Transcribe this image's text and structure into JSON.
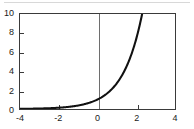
{
  "figure": {
    "source_id": "SAM0186-1Y",
    "axis_color": "#3a3a3a",
    "curve_color": "#111111",
    "reference_line_color": "#6e6e6e",
    "background": "#ffffff"
  },
  "chart_data": {
    "type": "line",
    "title": "",
    "subtitle": "",
    "xlabel": "",
    "ylabel": "",
    "xlim": [
      -4,
      4
    ],
    "ylim": [
      0,
      10
    ],
    "xticks": [
      -4,
      -2,
      0,
      2,
      4
    ],
    "yticks": [
      0,
      2,
      4,
      6,
      8,
      10
    ],
    "xtick_labels": [
      "-4",
      "-2",
      "0",
      "2",
      "4"
    ],
    "ytick_labels": [
      "0",
      "2",
      "4",
      "6",
      "8",
      "10"
    ],
    "grid": false,
    "legend": null,
    "legend_position": "none",
    "annotations": [
      {
        "text": "vertical reference line at x = 0",
        "x": 0
      }
    ],
    "series": [
      {
        "name": "exponential",
        "expression": "y = e^x",
        "x": [
          -4.0,
          -3.5,
          -3.0,
          -2.5,
          -2.0,
          -1.5,
          -1.0,
          -0.5,
          0.0,
          0.5,
          1.0,
          1.5,
          2.0,
          2.3
        ],
        "values": [
          0.02,
          0.03,
          0.05,
          0.08,
          0.14,
          0.22,
          0.37,
          0.61,
          1.0,
          1.65,
          2.72,
          4.48,
          7.39,
          10.0
        ],
        "clipped_at_top": true,
        "top_exit_x": 2.3
      }
    ]
  }
}
